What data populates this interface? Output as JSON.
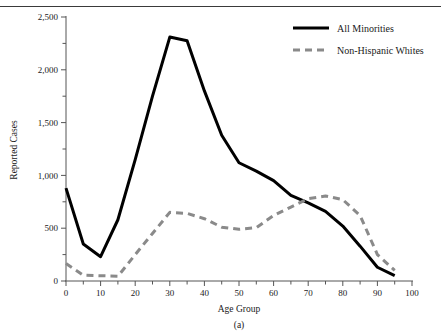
{
  "figure": {
    "caption": "(a)",
    "top_rule": true
  },
  "chart_data": {
    "type": "line",
    "title": "",
    "xlabel": "Age Group",
    "ylabel": "Reported Cases",
    "xlim": [
      0,
      100
    ],
    "ylim": [
      0,
      2500
    ],
    "xticks": [
      0,
      10,
      20,
      30,
      40,
      50,
      60,
      70,
      80,
      90,
      100
    ],
    "xtick_labels": [
      "0",
      "10",
      "20",
      "30",
      "40",
      "50",
      "60",
      "70",
      "80",
      "90",
      "100"
    ],
    "xminor_step": 5,
    "yticks": [
      0,
      500,
      1000,
      1500,
      2000,
      2500
    ],
    "ytick_labels": [
      "0",
      "500",
      "1,000",
      "1,500",
      "2,000",
      "2,500"
    ],
    "yminor_step": 250,
    "grid": false,
    "legend_position": "top-right",
    "x": [
      0,
      5,
      10,
      15,
      20,
      25,
      30,
      35,
      40,
      45,
      50,
      55,
      60,
      65,
      70,
      75,
      80,
      85,
      90,
      95
    ],
    "series": [
      {
        "name": "All Minorities",
        "style": "solid",
        "color": "#000000",
        "width": 3,
        "values": [
          880,
          350,
          230,
          580,
          1150,
          1750,
          2310,
          2275,
          1800,
          1380,
          1120,
          1040,
          950,
          810,
          740,
          660,
          520,
          330,
          130,
          50
        ]
      },
      {
        "name": "Non-Hispanic Whites",
        "style": "dashed",
        "color": "#8a8a8a",
        "width": 3,
        "values": [
          165,
          55,
          50,
          45,
          250,
          450,
          650,
          640,
          590,
          510,
          490,
          505,
          620,
          700,
          780,
          805,
          770,
          620,
          250,
          100
        ]
      }
    ]
  },
  "legend": {
    "items": [
      {
        "label": "All Minorities",
        "style": "solid",
        "color": "#000000"
      },
      {
        "label": "Non-Hispanic Whites",
        "style": "dashed",
        "color": "#8a8a8a"
      }
    ]
  }
}
